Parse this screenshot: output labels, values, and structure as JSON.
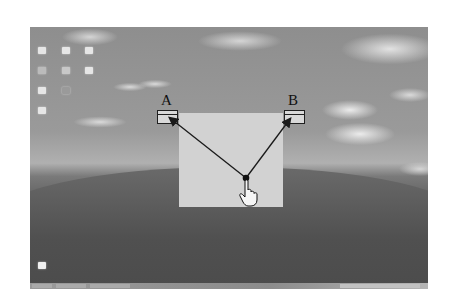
{
  "desktop": {
    "wallpaper": "hill-and-sky",
    "icons_grid": [
      {
        "row": 0,
        "col": 0
      },
      {
        "row": 0,
        "col": 1
      },
      {
        "row": 0,
        "col": 2
      },
      {
        "row": 1,
        "col": 0
      },
      {
        "row": 1,
        "col": 1
      },
      {
        "row": 1,
        "col": 2
      },
      {
        "row": 2,
        "col": 0
      },
      {
        "row": 2,
        "col": 1
      },
      {
        "row": 3,
        "col": 0
      }
    ],
    "bottom_icon": "recycle-bin"
  },
  "diagram": {
    "source_label": "A",
    "target_label": "B",
    "gesture": "drag from pointer to folder A and folder B",
    "line_color": "#1a1a1a",
    "panel_color": "#d2d2d2"
  },
  "taskbar": {
    "visible": true
  }
}
